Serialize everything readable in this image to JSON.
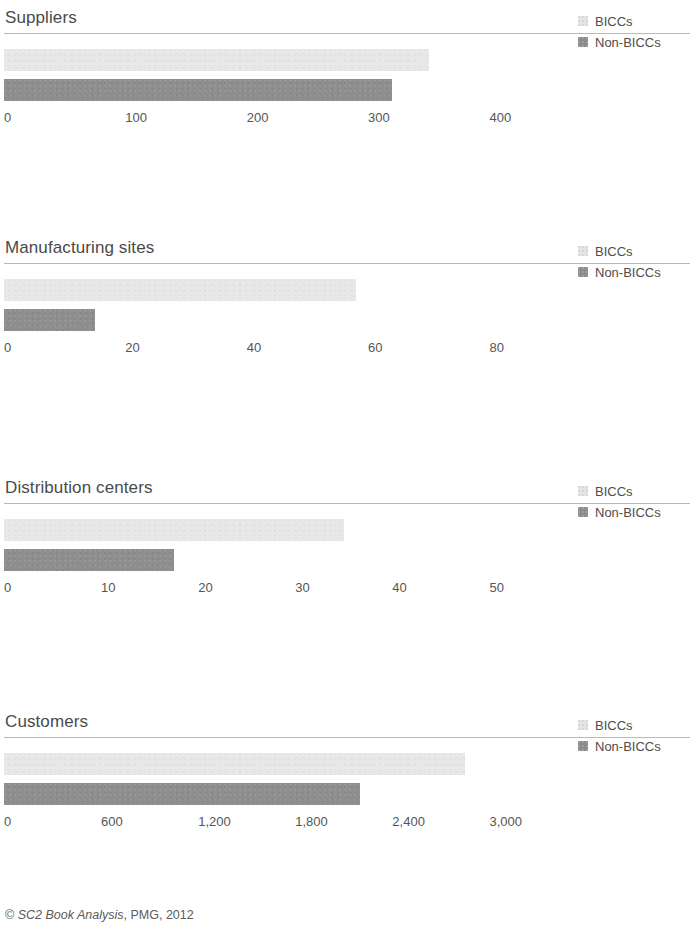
{
  "footer": {
    "copyright_symbol": "©",
    "source": "SC2 Book Analysis",
    "rest": ", PMG, 2012"
  },
  "legend": {
    "items": [
      {
        "label": "BICCs",
        "style": "light",
        "color": "#e4e4e4"
      },
      {
        "label": "Non-BICCs",
        "style": "dark",
        "color": "#8c8c8c"
      }
    ]
  },
  "colors": {
    "biccs": "#e8e8e8",
    "non_biccs": "#8e8e8e",
    "rule": "#b9b9b9",
    "text": "#4b4b4b"
  },
  "chart_data": [
    {
      "type": "bar",
      "title": "Suppliers",
      "orientation": "horizontal",
      "xlabel": "",
      "ylabel": "",
      "categories": [
        "BICCs",
        "Non-BICCs"
      ],
      "series": [
        {
          "name": "BICCs",
          "values": [
            350
          ]
        },
        {
          "name": "Non-BICCs",
          "values": [
            320
          ]
        }
      ],
      "ticks": [
        0,
        100,
        200,
        300,
        400
      ],
      "tick_labels": [
        "0",
        "100",
        "200",
        "300",
        "400"
      ],
      "xlim": [
        0,
        440
      ],
      "grid": false,
      "legend_position": "right"
    },
    {
      "type": "bar",
      "title": "Manufacturing sites",
      "orientation": "horizontal",
      "xlabel": "",
      "ylabel": "",
      "categories": [
        "BICCs",
        "Non-BICCs"
      ],
      "series": [
        {
          "name": "BICCs",
          "values": [
            58
          ]
        },
        {
          "name": "Non-BICCs",
          "values": [
            15
          ]
        }
      ],
      "ticks": [
        0,
        20,
        40,
        60,
        80
      ],
      "tick_labels": [
        "0",
        "20",
        "40",
        "60",
        "80"
      ],
      "xlim": [
        0,
        88
      ],
      "grid": false,
      "legend_position": "right"
    },
    {
      "type": "bar",
      "title": "Distribution centers",
      "orientation": "horizontal",
      "xlabel": "",
      "ylabel": "",
      "categories": [
        "BICCs",
        "Non-BICCs"
      ],
      "series": [
        {
          "name": "BICCs",
          "values": [
            35
          ]
        },
        {
          "name": "Non-BICCs",
          "values": [
            17.5
          ]
        }
      ],
      "ticks": [
        0,
        10,
        20,
        30,
        40,
        50
      ],
      "tick_labels": [
        "0",
        "10",
        "20",
        "30",
        "40",
        "50"
      ],
      "xlim": [
        0,
        55
      ],
      "grid": false,
      "legend_position": "right"
    },
    {
      "type": "bar",
      "title": "Customers",
      "orientation": "horizontal",
      "xlabel": "",
      "ylabel": "",
      "categories": [
        "BICCs",
        "Non-BICCs"
      ],
      "series": [
        {
          "name": "BICCs",
          "values": [
            2850
          ]
        },
        {
          "name": "Non-BICCs",
          "values": [
            2200
          ]
        }
      ],
      "ticks": [
        0,
        600,
        1200,
        1800,
        2400,
        3000
      ],
      "tick_labels": [
        "0",
        "600",
        "1,200",
        "1,800",
        "2,400",
        "3,000"
      ],
      "xlim": [
        0,
        3300
      ],
      "grid": false,
      "legend_position": "right"
    }
  ]
}
